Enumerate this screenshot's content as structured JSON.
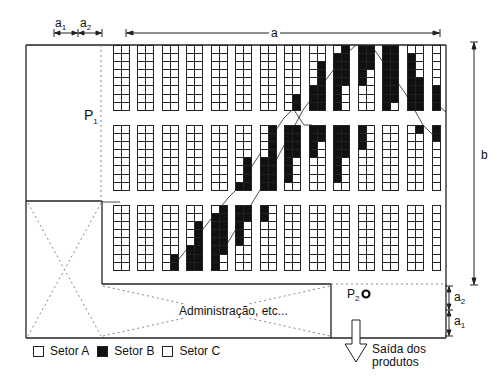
{
  "figure": {
    "dimension_labels": {
      "a": "a",
      "a1_top": "a",
      "a1_top_sub": "1",
      "a2_top": "a",
      "a2_top_sub": "2",
      "b": "b",
      "a2_right": "a",
      "a2_right_sub": "2",
      "a1_right": "a",
      "a1_right_sub": "1"
    },
    "points": {
      "p1": "P",
      "p1_sub": "1",
      "p2": "P",
      "p2_sub": "2"
    },
    "admin_label": "Administração, etc...",
    "exit_label_line1": "Saída dos",
    "exit_label_line2": "produtos",
    "legend": [
      {
        "label": "Setor A",
        "fill": "white"
      },
      {
        "label": "Setor B",
        "fill": "black"
      },
      {
        "label": "Setor C",
        "fill": "white"
      }
    ],
    "colors": {
      "line": "#222222",
      "sector_b": "#111111",
      "background": "#ffffff"
    },
    "rack_layout": {
      "bands": 3,
      "racks_per_band": 14,
      "rows_per_rack": 8,
      "columns_per_rack": 2,
      "last_rack_columns": 1,
      "rack_x": [
        113,
        137,
        162,
        186,
        211,
        235,
        260,
        284,
        309,
        333,
        358,
        382,
        407,
        432
      ],
      "band_y": [
        45,
        125,
        205
      ]
    },
    "sector_b_cells": {
      "band_1": [
        {
          "rack": 7,
          "col": 1,
          "rows": [
            6,
            7
          ]
        },
        {
          "rack": 8,
          "col": 0,
          "rows": [
            5,
            6,
            7
          ]
        },
        {
          "rack": 8,
          "col": 1,
          "rows": [
            2,
            3,
            4,
            5,
            6,
            7
          ]
        },
        {
          "rack": 9,
          "col": 0,
          "rows": [
            1,
            2,
            3,
            4,
            5,
            6,
            7
          ]
        },
        {
          "rack": 9,
          "col": 1,
          "rows": [
            0,
            1,
            2,
            3,
            4
          ]
        },
        {
          "rack": 10,
          "col": 0,
          "rows": [
            0,
            1,
            2,
            3,
            4
          ]
        },
        {
          "rack": 10,
          "col": 1,
          "rows": [
            0,
            1,
            2
          ]
        },
        {
          "rack": 11,
          "col": 0,
          "rows": [
            0,
            1,
            2,
            3,
            4,
            5,
            6,
            7
          ]
        },
        {
          "rack": 11,
          "col": 1,
          "rows": [
            0,
            1,
            2,
            3,
            4,
            5,
            6
          ]
        },
        {
          "rack": 12,
          "col": 0,
          "rows": [
            1,
            2,
            3,
            4,
            5,
            6,
            7
          ]
        },
        {
          "rack": 12,
          "col": 1,
          "rows": [
            4,
            5,
            6,
            7
          ]
        },
        {
          "rack": 13,
          "col": 0,
          "rows": [
            5,
            6,
            7
          ]
        }
      ],
      "band_2": [
        {
          "rack": 5,
          "col": 1,
          "rows": [
            4,
            5,
            6,
            7
          ]
        },
        {
          "rack": 5,
          "col": 0,
          "rows": [
            7
          ]
        },
        {
          "rack": 6,
          "col": 1,
          "rows": [
            0,
            1,
            2,
            3,
            4,
            5,
            6,
            7
          ]
        },
        {
          "rack": 6,
          "col": 0,
          "rows": [
            4,
            5,
            6,
            7
          ]
        },
        {
          "rack": 7,
          "col": 0,
          "rows": [
            0,
            1,
            2,
            3,
            4,
            5,
            6
          ]
        },
        {
          "rack": 7,
          "col": 1,
          "rows": [
            0,
            1,
            2,
            3
          ]
        },
        {
          "rack": 8,
          "col": 0,
          "rows": [
            0,
            1,
            2,
            3
          ]
        },
        {
          "rack": 8,
          "col": 1,
          "rows": [
            0,
            1
          ]
        },
        {
          "rack": 9,
          "col": 0,
          "rows": [
            0,
            1,
            2,
            3,
            4,
            5,
            6
          ]
        },
        {
          "rack": 9,
          "col": 1,
          "rows": [
            0,
            1,
            2,
            3
          ]
        },
        {
          "rack": 10,
          "col": 0,
          "rows": [
            0,
            1,
            2
          ]
        },
        {
          "rack": 12,
          "col": 1,
          "rows": [
            0
          ]
        },
        {
          "rack": 13,
          "col": 0,
          "rows": [
            0,
            1
          ]
        }
      ],
      "band_3": [
        {
          "rack": 2,
          "col": 1,
          "rows": [
            6,
            7
          ]
        },
        {
          "rack": 3,
          "col": 0,
          "rows": [
            5,
            6,
            7
          ]
        },
        {
          "rack": 3,
          "col": 1,
          "rows": [
            2,
            3,
            4,
            5,
            6,
            7
          ]
        },
        {
          "rack": 4,
          "col": 0,
          "rows": [
            1,
            2,
            3,
            4,
            5,
            6,
            7
          ]
        },
        {
          "rack": 4,
          "col": 1,
          "rows": [
            0,
            1,
            2,
            3,
            4,
            5
          ]
        },
        {
          "rack": 5,
          "col": 0,
          "rows": [
            0,
            1,
            2,
            3,
            4
          ]
        },
        {
          "rack": 5,
          "col": 1,
          "rows": [
            0,
            1
          ]
        },
        {
          "rack": 6,
          "col": 0,
          "rows": [
            0,
            1
          ]
        }
      ]
    }
  }
}
